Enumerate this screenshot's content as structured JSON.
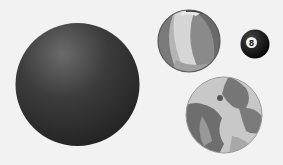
{
  "scene": {
    "background": "#f2f2f2",
    "objects": [
      {
        "name": "dark-sphere",
        "color": "#3a3a3a"
      },
      {
        "name": "beach-ball"
      },
      {
        "name": "eight-ball",
        "label": "8"
      },
      {
        "name": "globe"
      }
    ]
  }
}
